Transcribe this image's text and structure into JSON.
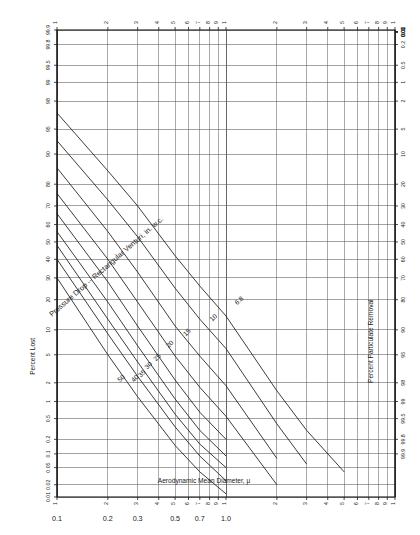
{
  "figure": {
    "title": "Pressure Drop -- Rectangular Venturi, in. w.c.",
    "background": "#ffffff",
    "line_color": "#1a1a1a",
    "grid_color": "#555555"
  },
  "axes": {
    "x": {
      "label": "Aerodynamic Mean Diameter, μ",
      "scale": "log",
      "range": [
        0.1,
        10
      ],
      "major_ticks": [
        0.1,
        0.2,
        0.3,
        0.5,
        0.7,
        1.0
      ],
      "major_tick_labels": [
        "0.1",
        "0.2",
        "0.3",
        "0.5",
        "0.7",
        "1.0"
      ],
      "top_tick_labels": [
        "1",
        "2",
        "3",
        "4",
        "5",
        "6",
        "7",
        "8",
        "9",
        "1",
        "2",
        "3",
        "4",
        "5",
        "6",
        "7",
        "8",
        "9",
        "1"
      ],
      "minor_ticks": [
        0.1,
        0.2,
        0.3,
        0.4,
        0.5,
        0.6,
        0.7,
        0.8,
        0.9,
        1.0,
        2,
        3,
        4,
        5,
        6,
        7,
        8,
        9,
        10
      ]
    },
    "y_left": {
      "label": "Percent Lost",
      "scale": "probability",
      "tick_labels": [
        "99.9",
        "99.8",
        "99.5",
        "99",
        "98",
        "95",
        "90",
        "80",
        "70",
        "60",
        "50",
        "40",
        "30",
        "20",
        "10",
        "5",
        "2",
        "1",
        "0.5",
        "0.2",
        "0.1",
        "0.05",
        "0.02",
        "0.01"
      ],
      "tick_values": [
        99.9,
        99.8,
        99.5,
        99,
        98,
        95,
        90,
        80,
        70,
        60,
        50,
        40,
        30,
        20,
        10,
        5,
        2,
        1,
        0.5,
        0.2,
        0.1,
        0.05,
        0.02,
        0.01
      ]
    },
    "y_right": {
      "label": "Percent Particulate Removal",
      "scale": "probability",
      "tick_labels": [
        "0.01",
        "0.02",
        "0.05",
        "0.1",
        "0.2",
        "0.5",
        "1",
        "2",
        "5",
        "10",
        "20",
        "30",
        "40",
        "50",
        "60",
        "70",
        "80",
        "90",
        "95",
        "98",
        "99",
        "99.5",
        "99.8",
        "99.9"
      ],
      "tick_values": [
        0.01,
        0.02,
        0.05,
        0.1,
        0.2,
        0.5,
        1,
        2,
        5,
        10,
        20,
        30,
        40,
        50,
        60,
        70,
        80,
        90,
        95,
        98,
        99,
        99.5,
        99.8,
        99.9
      ]
    }
  },
  "chart_data": {
    "type": "line",
    "title": "Pressure Drop -- Rectangular Venturi, in. w.c.",
    "xlabel": "Aerodynamic Mean Diameter, μ",
    "ylabel": "Percent Lost",
    "ylabel_right": "Percent Particulate Removal",
    "xscale": "log",
    "yscale": "probability",
    "xlim": [
      0.1,
      10
    ],
    "ylim_percent_lost": [
      99.9,
      0.01
    ],
    "grid": true,
    "legend": "inline curve labels",
    "series": [
      {
        "name": "50",
        "label": "50",
        "pressure_drop_in_wc": 50,
        "x": [
          0.1,
          0.2,
          0.3,
          0.5,
          0.7,
          1.0
        ],
        "percent_lost": [
          30,
          5,
          1.2,
          0.15,
          0.04,
          0.012
        ]
      },
      {
        "name": "40",
        "label": "40",
        "pressure_drop_in_wc": 40,
        "x": [
          0.1,
          0.2,
          0.3,
          0.5,
          0.7,
          1.0
        ],
        "percent_lost": [
          40,
          9,
          2.5,
          0.35,
          0.09,
          0.025
        ]
      },
      {
        "name": "35",
        "label": "35",
        "pressure_drop_in_wc": 35,
        "x": [
          0.1,
          0.2,
          0.3,
          0.5,
          0.7,
          1.0
        ],
        "percent_lost": [
          48,
          13,
          4,
          0.6,
          0.16,
          0.05
        ]
      },
      {
        "name": "30",
        "label": "30",
        "pressure_drop_in_wc": 30,
        "x": [
          0.1,
          0.2,
          0.3,
          0.5,
          0.7,
          1.0
        ],
        "percent_lost": [
          56,
          19,
          6.5,
          1.1,
          0.3,
          0.09
        ]
      },
      {
        "name": "25",
        "label": "25",
        "pressure_drop_in_wc": 25,
        "x": [
          0.1,
          0.2,
          0.3,
          0.5,
          0.7,
          1.0
        ],
        "percent_lost": [
          66,
          28,
          11,
          2.2,
          0.65,
          0.2
        ]
      },
      {
        "name": "20",
        "label": "20",
        "pressure_drop_in_wc": 20,
        "x": [
          0.1,
          0.2,
          0.3,
          0.5,
          0.7,
          1.0,
          2.0
        ],
        "percent_lost": [
          76,
          40,
          19,
          4.8,
          1.7,
          0.55,
          0.02
        ]
      },
      {
        "name": "15",
        "label": "15",
        "pressure_drop_in_wc": 15,
        "x": [
          0.1,
          0.2,
          0.3,
          0.5,
          0.7,
          1.0,
          2.0
        ],
        "percent_lost": [
          86,
          56,
          33,
          11,
          4.8,
          1.8,
          0.08
        ]
      },
      {
        "name": "10",
        "label": "10",
        "pressure_drop_in_wc": 10,
        "x": [
          0.1,
          0.2,
          0.3,
          0.5,
          0.7,
          1.0,
          2.0,
          3.0
        ],
        "percent_lost": [
          93,
          73,
          53,
          25,
          13,
          6,
          0.4,
          0.06
        ]
      },
      {
        "name": "6.8",
        "label": "6.8",
        "pressure_drop_in_wc": 6.8,
        "x": [
          0.1,
          0.2,
          0.3,
          0.5,
          0.7,
          1.0,
          2.0,
          3.0,
          5.0
        ],
        "percent_lost": [
          97,
          85,
          70,
          42,
          26,
          14,
          1.5,
          0.3,
          0.04
        ]
      }
    ],
    "curve_labels": [
      "50",
      "40",
      "35",
      "30",
      "25",
      "20",
      "15",
      "10",
      "6.8"
    ]
  }
}
